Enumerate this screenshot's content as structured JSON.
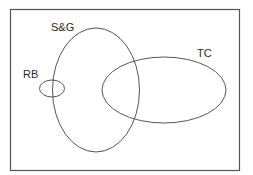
{
  "diagram": {
    "type": "venn",
    "frame": {
      "x": 10,
      "y": 9,
      "width": 229,
      "height": 161,
      "stroke": "#555555"
    },
    "sets": [
      {
        "label": "S&G",
        "cx": 96,
        "cy": 90,
        "rx": 43.5,
        "ry": 62,
        "label_x": 51,
        "label_y": 31
      },
      {
        "label": "RB",
        "cx": 52,
        "cy": 88,
        "rx": 12.5,
        "ry": 8.5,
        "label_x": 23,
        "label_y": 78
      },
      {
        "label": "TC",
        "cx": 164,
        "cy": 90,
        "rx": 62,
        "ry": 33,
        "label_x": 197,
        "label_y": 57
      }
    ],
    "line_color": "#555555"
  }
}
